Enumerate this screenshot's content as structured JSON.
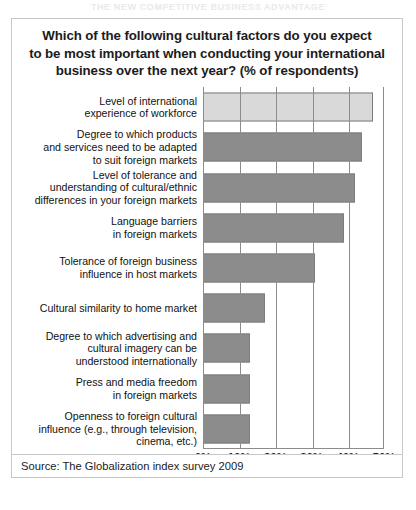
{
  "page_header": "THE NEW COMPETITIVE BUSINESS ADVANTAGE",
  "figure": {
    "title_lines": [
      "Which of the following cultural factors do you expect",
      "to be most important when conducting your international",
      "business over the next year? (% of respondents)"
    ],
    "source_note": "Source: The Globalization index survey 2009"
  },
  "colors": {
    "bar_highlight": "#d9d9d9",
    "bar_default": "#8c8c8c",
    "bar_border": "#7c7c7c",
    "axis": "#8c8c8c",
    "text": "#111111"
  },
  "chart_data": {
    "type": "bar",
    "orientation": "horizontal",
    "title": "Which of the following cultural factors do you expect to be most important when conducting your international business over the next year? (% of respondents)",
    "xlabel": "",
    "ylabel": "",
    "xlim": [
      0,
      50
    ],
    "grid": true,
    "legend": false,
    "tick_labels": [
      "0%",
      "10%",
      "20%",
      "30%",
      "40%",
      "50%"
    ],
    "tick_values": [
      0,
      10,
      20,
      30,
      40,
      50
    ],
    "categories": [
      "Level of international experience of workforce",
      "Degree to which products and services need to be adapted to suit foreign markets",
      "Level of tolerance and understanding of cultural/ethnic differences in your foreign markets",
      "Language barriers in foreign markets",
      "Tolerance of foreign business influence in host markets",
      "Cultural similarity to home market",
      "Degree to which advertising and cultural imagery can be understood internationally",
      "Press and media freedom in foreign markets",
      "Openness to foreign cultural influence (e.g., through television, cinema, etc.)"
    ],
    "values": [
      47,
      44,
      42,
      39,
      31,
      17,
      13,
      13,
      13
    ],
    "bars": [
      {
        "label_lines": [
          "Level of international",
          "experience of workforce"
        ],
        "value": 47,
        "highlight": true
      },
      {
        "label_lines": [
          "Degree to which products",
          "and services need to be adapted",
          "to suit foreign markets"
        ],
        "value": 44,
        "highlight": false
      },
      {
        "label_lines": [
          "Level of tolerance and",
          "understanding of cultural/ethnic",
          "differences in your foreign markets"
        ],
        "value": 42,
        "highlight": false
      },
      {
        "label_lines": [
          "Language barriers",
          "in foreign markets"
        ],
        "value": 39,
        "highlight": false
      },
      {
        "label_lines": [
          "Tolerance of foreign business",
          "influence in host markets"
        ],
        "value": 31,
        "highlight": false
      },
      {
        "label_lines": [
          "Cultural similarity to home market"
        ],
        "value": 17,
        "highlight": false
      },
      {
        "label_lines": [
          "Degree to which advertising and",
          "cultural imagery can be",
          "understood internationally"
        ],
        "value": 13,
        "highlight": false
      },
      {
        "label_lines": [
          "Press and media freedom",
          "in foreign markets"
        ],
        "value": 13,
        "highlight": false
      },
      {
        "label_lines": [
          "Openness to foreign cultural",
          "influence (e.g., through television,",
          "cinema, etc.)"
        ],
        "value": 13,
        "highlight": false
      }
    ]
  }
}
